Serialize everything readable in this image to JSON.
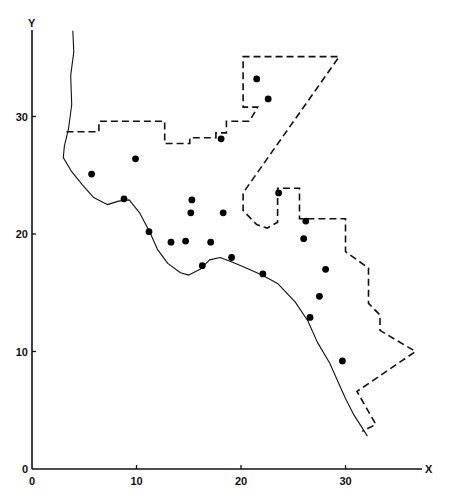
{
  "chart_data": {
    "type": "scatter",
    "title": "",
    "xlabel": "X",
    "ylabel": "Y",
    "xlim": [
      0,
      40
    ],
    "ylim": [
      0,
      38
    ],
    "xticks": [
      0,
      10,
      20,
      30
    ],
    "yticks": [
      0,
      10,
      20,
      30
    ],
    "grid": false,
    "legend": null,
    "series": [
      {
        "name": "sample points",
        "marker": "filled-circle",
        "points": [
          {
            "x": 5.7,
            "y": 25.1
          },
          {
            "x": 9.9,
            "y": 26.4
          },
          {
            "x": 8.8,
            "y": 23.0
          },
          {
            "x": 11.2,
            "y": 20.2
          },
          {
            "x": 13.3,
            "y": 19.3
          },
          {
            "x": 14.7,
            "y": 19.4
          },
          {
            "x": 15.3,
            "y": 22.9
          },
          {
            "x": 15.2,
            "y": 21.8
          },
          {
            "x": 17.1,
            "y": 19.3
          },
          {
            "x": 18.3,
            "y": 21.8
          },
          {
            "x": 16.3,
            "y": 17.3
          },
          {
            "x": 19.1,
            "y": 18.0
          },
          {
            "x": 22.1,
            "y": 16.6
          },
          {
            "x": 18.1,
            "y": 28.1
          },
          {
            "x": 21.5,
            "y": 33.2
          },
          {
            "x": 22.6,
            "y": 31.5
          },
          {
            "x": 23.6,
            "y": 23.5
          },
          {
            "x": 26.2,
            "y": 21.1
          },
          {
            "x": 26.0,
            "y": 19.6
          },
          {
            "x": 28.1,
            "y": 17.0
          },
          {
            "x": 27.5,
            "y": 14.7
          },
          {
            "x": 26.6,
            "y": 12.9
          },
          {
            "x": 29.7,
            "y": 9.2
          }
        ]
      }
    ],
    "boundaries": [
      {
        "name": "coastline",
        "style": "solid",
        "points": [
          [
            3.9,
            37.3
          ],
          [
            4.0,
            35.5
          ],
          [
            3.7,
            33.5
          ],
          [
            3.8,
            31.0
          ],
          [
            3.5,
            29.0
          ],
          [
            3.1,
            27.5
          ],
          [
            3.0,
            26.5
          ],
          [
            3.8,
            25.3
          ],
          [
            4.8,
            24.2
          ],
          [
            5.9,
            23.1
          ],
          [
            7.2,
            22.5
          ],
          [
            8.3,
            22.8
          ],
          [
            9.3,
            22.9
          ],
          [
            10.3,
            21.8
          ],
          [
            11.3,
            20.1
          ],
          [
            12.0,
            18.7
          ],
          [
            13.0,
            17.5
          ],
          [
            14.2,
            16.7
          ],
          [
            15.0,
            16.5
          ],
          [
            16.1,
            17.0
          ],
          [
            17.0,
            17.8
          ],
          [
            18.0,
            18.0
          ],
          [
            19.2,
            17.6
          ],
          [
            20.5,
            17.1
          ],
          [
            22.0,
            16.5
          ],
          [
            23.5,
            15.8
          ],
          [
            25.2,
            14.2
          ],
          [
            26.4,
            12.6
          ],
          [
            27.3,
            10.8
          ],
          [
            28.5,
            9.0
          ],
          [
            29.2,
            7.6
          ],
          [
            30.0,
            6.0
          ],
          [
            30.8,
            4.6
          ],
          [
            31.6,
            3.5
          ],
          [
            32.1,
            2.8
          ]
        ]
      },
      {
        "name": "study-area-boundary",
        "style": "dashed",
        "points": [
          [
            3.3,
            28.7
          ],
          [
            6.4,
            28.7
          ],
          [
            6.4,
            29.6
          ],
          [
            12.7,
            29.6
          ],
          [
            12.7,
            27.7
          ],
          [
            15.1,
            27.7
          ],
          [
            15.1,
            28.2
          ],
          [
            17.6,
            28.2
          ],
          [
            17.6,
            28.6
          ],
          [
            18.6,
            28.6
          ],
          [
            18.6,
            29.6
          ],
          [
            20.8,
            29.6
          ],
          [
            21.6,
            30.8
          ],
          [
            20.2,
            30.8
          ],
          [
            20.2,
            35.1
          ],
          [
            29.4,
            35.1
          ],
          [
            20.2,
            23.5
          ],
          [
            20.2,
            22.0
          ],
          [
            21.5,
            20.8
          ],
          [
            22.5,
            20.5
          ],
          [
            23.5,
            21.0
          ],
          [
            23.5,
            23.9
          ],
          [
            25.6,
            23.9
          ],
          [
            25.6,
            21.3
          ],
          [
            30.0,
            21.3
          ],
          [
            30.0,
            18.5
          ],
          [
            32.2,
            17.1
          ],
          [
            32.2,
            14.1
          ],
          [
            33.3,
            13.1
          ],
          [
            33.3,
            11.8
          ],
          [
            36.7,
            10.0
          ],
          [
            31.1,
            6.6
          ],
          [
            32.9,
            3.8
          ],
          [
            31.6,
            3.2
          ]
        ]
      }
    ]
  },
  "axes": {
    "x_label": "X",
    "y_label": "Y",
    "x_tick_labels": [
      "0",
      "10",
      "20",
      "30"
    ],
    "y_tick_labels": [
      "0",
      "10",
      "20",
      "30"
    ]
  }
}
